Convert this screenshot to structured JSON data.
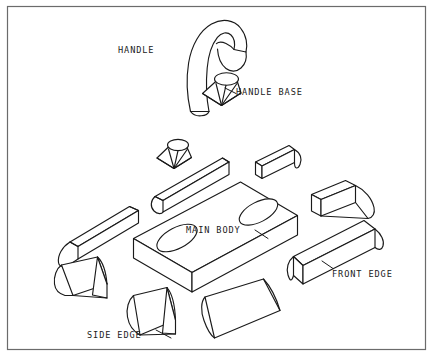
{
  "diagram": {
    "background_color": "#ffffff",
    "line_color": "#1a1a1a",
    "frame_color": "#6b6b6b",
    "labels": {
      "handle": "HANDLE",
      "handle_base": "HANDLE BASE",
      "main_body": "MAIN BODY",
      "front_edge": "FRONT EDGE",
      "side_edge": "SIDE EDGE"
    },
    "parts": [
      {
        "name": "handle",
        "label": "HANDLE",
        "shape": "curved-hook",
        "count": 1
      },
      {
        "name": "handle-base",
        "label": "HANDLE BASE",
        "shape": "faceted-cone",
        "count": 2
      },
      {
        "name": "main-body",
        "label": "MAIN BODY",
        "shape": "isometric-slab-with-two-holes",
        "count": 1
      },
      {
        "name": "front-edge",
        "label": "FRONT EDGE",
        "shape": "rounded-bar",
        "count": 1
      },
      {
        "name": "side-edge",
        "label": "SIDE EDGE",
        "shape": "rounded-bar",
        "count": 1
      }
    ]
  }
}
